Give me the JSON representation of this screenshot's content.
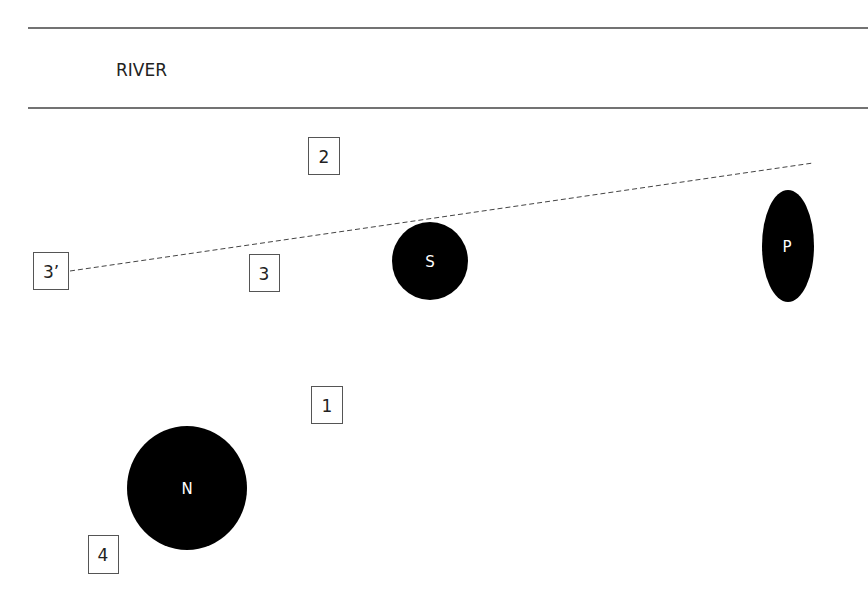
{
  "diagram": {
    "river": {
      "label": "RIVER"
    },
    "markers": [
      {
        "id": "2",
        "label": "2"
      },
      {
        "id": "3prime",
        "label": "3’"
      },
      {
        "id": "3",
        "label": "3"
      },
      {
        "id": "1",
        "label": "1"
      },
      {
        "id": "4",
        "label": "4"
      }
    ],
    "bodies": [
      {
        "id": "S",
        "label": "S",
        "shape": "circle"
      },
      {
        "id": "P",
        "label": "P",
        "shape": "ellipse"
      },
      {
        "id": "N",
        "label": "N",
        "shape": "circle"
      }
    ],
    "colors": {
      "line": "#333333",
      "fill": "#000000",
      "text_on_fill": "#ffffff",
      "box_border": "#444444"
    }
  }
}
